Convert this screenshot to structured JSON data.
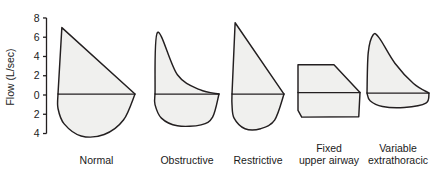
{
  "chart_data": {
    "type": "line",
    "title": "",
    "subtitle": "",
    "xlabel": "",
    "ylabel": "Flow (L/sec)",
    "ylim": [
      -4.6,
      8.4
    ],
    "grid": false,
    "legend_position": "none",
    "y_ticks": [
      {
        "value": 8,
        "label": "8"
      },
      {
        "value": 6,
        "label": "6"
      },
      {
        "value": 4,
        "label": "4"
      },
      {
        "value": 2,
        "label": "2"
      },
      {
        "value": 0,
        "label": "0"
      },
      {
        "value": -2,
        "label": "2"
      },
      {
        "value": -4,
        "label": "4"
      }
    ],
    "annotations": [
      "Expiratory flow is plotted above the zero line; inspiratory flow below.",
      "Each panel is a flow-volume loop for a different pulmonary pattern."
    ],
    "series": [
      {
        "name": "Normal",
        "label": "Normal",
        "label_lines": [
          "Normal"
        ],
        "peak_expiratory_flow": 7.0,
        "peak_inspiratory_flow": -4.2,
        "expiratory_shape": "straight linear decline from peak",
        "inspiratory_shape": "deep rounded semicircle",
        "points_expiratory": [
          [
            0.0,
            0.1
          ],
          [
            0.05,
            7.0
          ],
          [
            1.0,
            0.1
          ]
        ],
        "points_inspiratory": [
          [
            1.0,
            0.1
          ],
          [
            0.85,
            -2.6
          ],
          [
            0.6,
            -4.1
          ],
          [
            0.3,
            -4.25
          ],
          [
            0.08,
            -3.0
          ],
          [
            0.0,
            -1.4
          ],
          [
            0.0,
            0.1
          ]
        ]
      },
      {
        "name": "Obstructive",
        "label": "Obstructive",
        "label_lines": [
          "Obstructive"
        ],
        "peak_expiratory_flow": 6.5,
        "peak_inspiratory_flow": -3.2,
        "expiratory_shape": "scooped concave decline",
        "inspiratory_shape": "shallow rounded",
        "points_expiratory": [
          [
            0.0,
            0.1
          ],
          [
            0.04,
            6.5
          ],
          [
            0.35,
            2.1
          ],
          [
            0.7,
            0.55
          ],
          [
            1.0,
            0.1
          ]
        ],
        "points_inspiratory": [
          [
            1.0,
            0.1
          ],
          [
            0.9,
            -2.3
          ],
          [
            0.72,
            -3.1
          ],
          [
            0.35,
            -3.2
          ],
          [
            0.1,
            -2.4
          ],
          [
            0.0,
            -1.0
          ],
          [
            0.0,
            0.1
          ]
        ]
      },
      {
        "name": "Restrictive",
        "label": "Restrictive",
        "label_lines": [
          "Restrictive"
        ],
        "peak_expiratory_flow": 7.5,
        "peak_inspiratory_flow": -3.5,
        "expiratory_shape": "narrow tall linear decline",
        "inspiratory_shape": "narrow rounded",
        "points_expiratory": [
          [
            0.0,
            0.1
          ],
          [
            0.06,
            7.5
          ],
          [
            1.0,
            0.1
          ]
        ],
        "points_inspiratory": [
          [
            1.0,
            0.1
          ],
          [
            0.82,
            -2.6
          ],
          [
            0.55,
            -3.5
          ],
          [
            0.25,
            -3.5
          ],
          [
            0.04,
            -2.4
          ],
          [
            0.0,
            -1.0
          ],
          [
            0.0,
            0.1
          ]
        ]
      },
      {
        "name": "Fixed upper airway",
        "label": "Fixed upper airway",
        "label_lines": [
          "Fixed",
          "upper airway"
        ],
        "peak_expiratory_flow": 3.2,
        "peak_inspiratory_flow": -2.3,
        "expiratory_shape": "flat plateau then drop",
        "inspiratory_shape": "flat plateau",
        "points_expiratory": [
          [
            0.0,
            0.25
          ],
          [
            0.0,
            3.15
          ],
          [
            0.58,
            3.15
          ],
          [
            1.0,
            0.25
          ]
        ],
        "points_inspiratory": [
          [
            1.0,
            0.25
          ],
          [
            0.98,
            -2.25
          ],
          [
            0.06,
            -2.3
          ],
          [
            0.0,
            -1.6
          ],
          [
            0.0,
            0.25
          ]
        ]
      },
      {
        "name": "Variable extrathoracic",
        "label": "Variable extrathoracic",
        "label_lines": [
          "Variable",
          "extrathoracic"
        ],
        "peak_expiratory_flow": 6.3,
        "peak_inspiratory_flow": -1.3,
        "expiratory_shape": "rounded dome then concave tail",
        "inspiratory_shape": "flattened truncated plateau",
        "points_expiratory": [
          [
            0.0,
            0.2
          ],
          [
            0.02,
            4.4
          ],
          [
            0.1,
            6.25
          ],
          [
            0.2,
            5.9
          ],
          [
            0.45,
            3.3
          ],
          [
            0.75,
            1.2
          ],
          [
            1.0,
            0.2
          ]
        ],
        "points_inspiratory": [
          [
            1.0,
            0.2
          ],
          [
            0.95,
            -0.85
          ],
          [
            0.6,
            -1.3
          ],
          [
            0.25,
            -1.2
          ],
          [
            0.05,
            -0.6
          ],
          [
            0.0,
            0.2
          ]
        ]
      }
    ],
    "style": {
      "fill_color": "#f0f0ee",
      "stroke_color": "#231f20",
      "background": "#ffffff",
      "text_color": "#1a1a1a"
    }
  }
}
